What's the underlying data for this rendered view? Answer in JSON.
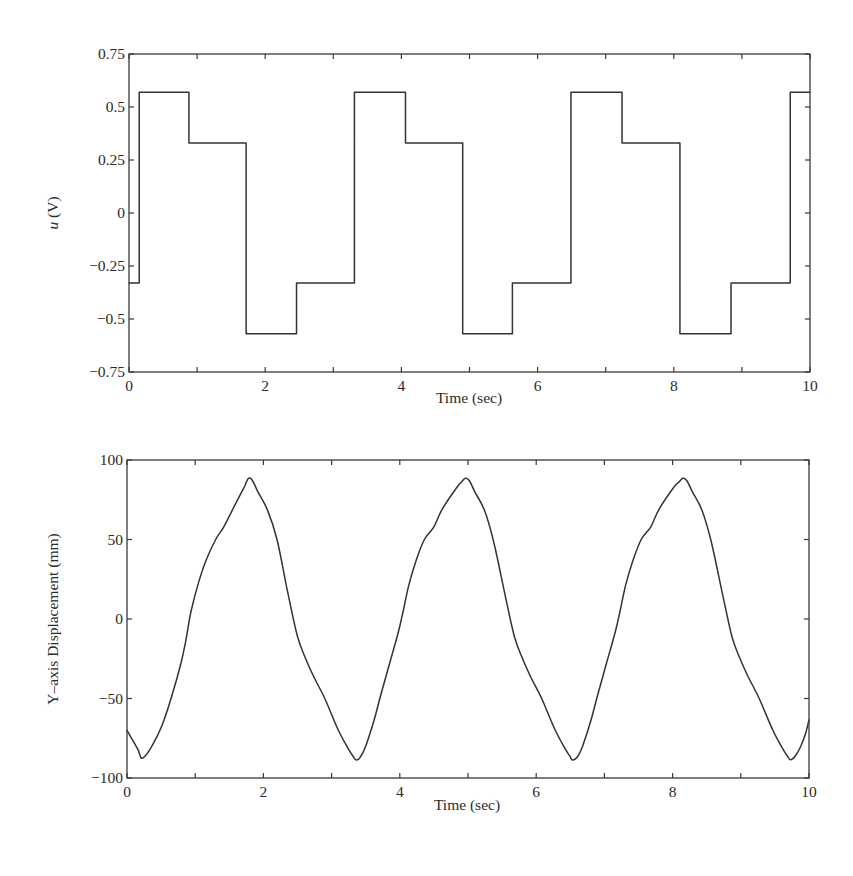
{
  "chart_data": [
    {
      "type": "line",
      "subtype": "step",
      "title": "",
      "xlabel": "Time (sec)",
      "ylabel": "u (V)",
      "ylabel_italic_part": "u",
      "ylabel_rest": " (V)",
      "xlim": [
        0,
        10
      ],
      "ylim": [
        -0.75,
        0.75
      ],
      "xticks": [
        0,
        2,
        4,
        6,
        8,
        10
      ],
      "xticks_minor": [
        1,
        3,
        5,
        7,
        9
      ],
      "xtick_labels": [
        "0",
        "2",
        "4",
        "6",
        "8",
        "10"
      ],
      "yticks": [
        0.75,
        0.5,
        0.25,
        0,
        -0.25,
        -0.5,
        -0.75
      ],
      "ytick_labels": [
        "0.75",
        "0.5",
        "0.25",
        "0",
        "−0.25",
        "−0.5",
        "−0.75"
      ],
      "grid": false,
      "legend": null,
      "series": [
        {
          "name": "u",
          "color": "#333333",
          "steps": [
            {
              "t": 0.0,
              "v": -0.33
            },
            {
              "t": 0.15,
              "v": 0.57
            },
            {
              "t": 0.88,
              "v": 0.33
            },
            {
              "t": 1.72,
              "v": -0.57
            },
            {
              "t": 2.46,
              "v": -0.33
            },
            {
              "t": 3.31,
              "v": 0.57
            },
            {
              "t": 4.06,
              "v": 0.33
            },
            {
              "t": 4.9,
              "v": -0.57
            },
            {
              "t": 5.63,
              "v": -0.33
            },
            {
              "t": 6.49,
              "v": 0.57
            },
            {
              "t": 7.24,
              "v": 0.33
            },
            {
              "t": 8.09,
              "v": -0.57
            },
            {
              "t": 8.84,
              "v": -0.33
            },
            {
              "t": 9.71,
              "v": 0.57
            },
            {
              "t": 10.0,
              "v": 0.57
            }
          ]
        }
      ]
    },
    {
      "type": "line",
      "title": "",
      "xlabel": "Time (sec)",
      "ylabel": "Y–axis Displacement (mm)",
      "xlim": [
        0,
        10
      ],
      "ylim": [
        -100,
        100
      ],
      "xticks": [
        0,
        2,
        4,
        6,
        8,
        10
      ],
      "xticks_minor": [
        1,
        3,
        5,
        7,
        9
      ],
      "xtick_labels": [
        "0",
        "2",
        "4",
        "6",
        "8",
        "10"
      ],
      "yticks": [
        100,
        50,
        0,
        -50,
        -100
      ],
      "ytick_labels": [
        "100",
        "50",
        "0",
        "−50",
        "−100"
      ],
      "grid": false,
      "legend": null,
      "series": [
        {
          "name": "Y-axis displacement",
          "color": "#333333",
          "x": [
            0.0,
            0.08,
            0.16,
            0.21,
            0.27,
            0.35,
            0.45,
            0.54,
            0.66,
            0.79,
            0.86,
            0.94,
            1.05,
            1.16,
            1.3,
            1.42,
            1.55,
            1.67,
            1.72,
            1.78,
            1.84,
            1.92,
            2.06,
            2.2,
            2.36,
            2.5,
            2.62,
            2.74,
            2.9,
            3.1,
            3.25,
            3.31,
            3.36,
            3.42,
            3.5,
            3.62,
            3.72,
            3.85,
            3.98,
            4.05,
            4.13,
            4.24,
            4.36,
            4.5,
            4.62,
            4.84,
            4.9,
            4.96,
            5.02,
            5.1,
            5.24,
            5.38,
            5.54,
            5.68,
            5.8,
            5.92,
            6.08,
            6.28,
            6.43,
            6.49,
            6.53,
            6.6,
            6.68,
            6.8,
            6.9,
            7.03,
            7.16,
            7.23,
            7.31,
            7.42,
            7.54,
            7.68,
            7.8,
            8.02,
            8.09,
            8.15,
            8.21,
            8.29,
            8.43,
            8.57,
            8.73,
            8.87,
            8.99,
            9.11,
            9.27,
            9.47,
            9.62,
            9.68,
            9.73,
            9.8,
            9.88,
            9.95,
            10.0
          ],
          "y": [
            -70,
            -76,
            -82,
            -87.5,
            -86,
            -81,
            -73,
            -64,
            -48,
            -28,
            -14,
            5,
            23,
            37,
            50,
            58,
            69,
            79,
            83,
            88.5,
            87,
            80,
            68.5,
            50,
            16,
            -11,
            -25,
            -36.5,
            -50,
            -70,
            -82,
            -86,
            -88.7,
            -87,
            -80,
            -64,
            -48,
            -28,
            -8,
            5,
            21,
            37,
            50,
            58,
            69,
            83,
            86,
            88.5,
            87,
            80,
            68.5,
            48,
            16,
            -11,
            -25,
            -36.5,
            -50,
            -70,
            -82,
            -86,
            -88.7,
            -87,
            -80,
            -64,
            -48,
            -28,
            -8,
            5,
            21,
            37,
            50,
            58,
            69,
            83,
            86,
            88.5,
            87,
            80,
            68.5,
            48,
            16,
            -11,
            -25,
            -36.5,
            -50,
            -70,
            -82,
            -86,
            -88.5,
            -86,
            -80,
            -72,
            -63.5
          ]
        }
      ]
    }
  ],
  "plots": {
    "top": {
      "ylabel_italic": "u",
      "ylabel_rest": " (V)",
      "xlabel": "Time (sec)"
    },
    "bottom": {
      "ylabel": "Y–axis Displacement (mm)",
      "xlabel": "Time (sec)"
    }
  }
}
